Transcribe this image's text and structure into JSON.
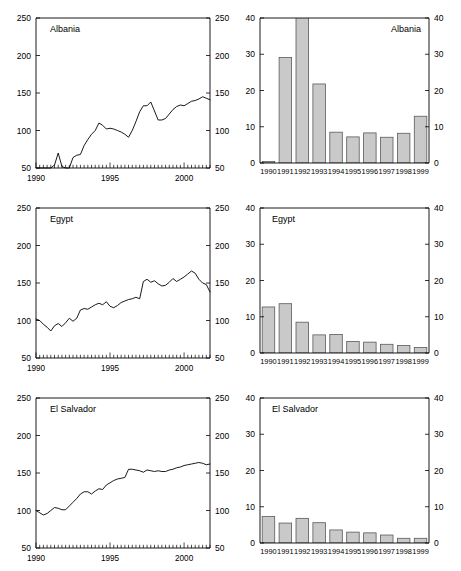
{
  "figure": {
    "layout": "3 rows x 2 columns",
    "rows": [
      "Albania",
      "Egypt",
      "El Salvador"
    ],
    "bar_fill_color": "#c9c9c9",
    "bar_stroke_color": "#5a5a5a",
    "line_color": "#000000",
    "background_color": "#ffffff"
  },
  "chart_data": [
    {
      "id": "albania-line",
      "type": "line",
      "title": "Albania",
      "title_position": "top-left",
      "xlabel": "",
      "ylabel": "",
      "xlim": [
        1990.0,
        2001.75
      ],
      "ylim": [
        50,
        250
      ],
      "yticks": [
        50,
        100,
        150,
        200,
        250
      ],
      "ytick_labels": [
        "50",
        "100",
        "150",
        "200",
        "250"
      ],
      "dual_y_axis": true,
      "xticks": [
        1990,
        1995,
        2000
      ],
      "xtick_labels": [
        "1990",
        "1995",
        "2000"
      ],
      "minor_xtick_interval": 0.25,
      "grid": false,
      "x": [
        1990.0,
        1990.25,
        1990.5,
        1990.75,
        1991.0,
        1991.25,
        1991.5,
        1991.75,
        1992.0,
        1992.25,
        1992.5,
        1992.75,
        1993.0,
        1993.25,
        1993.5,
        1993.75,
        1994.0,
        1994.25,
        1994.5,
        1994.75,
        1995.0,
        1995.25,
        1995.5,
        1995.75,
        1996.0,
        1996.25,
        1996.5,
        1996.75,
        1997.0,
        1997.25,
        1997.5,
        1997.75,
        1998.0,
        1998.25,
        1998.5,
        1998.75,
        1999.0,
        1999.25,
        1999.5,
        1999.75,
        2000.0,
        2000.25,
        2000.5,
        2000.75,
        2001.0,
        2001.25,
        2001.5,
        2001.75
      ],
      "y": [
        50,
        50,
        50,
        50,
        50,
        54,
        70,
        52,
        50,
        50,
        64,
        67,
        68,
        80,
        88,
        95,
        100,
        110,
        107,
        102,
        103,
        102,
        100,
        98,
        95,
        91,
        100,
        112,
        125,
        133,
        133,
        138,
        126,
        114,
        114,
        116,
        122,
        128,
        132,
        134,
        133,
        136,
        139,
        140,
        142,
        145,
        143,
        141
      ]
    },
    {
      "id": "albania-bar",
      "type": "bar",
      "title": "Albania",
      "title_position": "top-right",
      "xlabel": "",
      "ylabel": "",
      "ylim": [
        0,
        40
      ],
      "yticks": [
        0,
        10,
        20,
        30,
        40
      ],
      "ytick_labels": [
        "0",
        "10",
        "20",
        "30",
        "40"
      ],
      "dual_y_axis": true,
      "categories": [
        "1990",
        "1991",
        "1992",
        "1993",
        "1994",
        "1995",
        "1996",
        "1997",
        "1998",
        "1999"
      ],
      "values": [
        0.4,
        29.1,
        48.0,
        21.8,
        8.5,
        7.2,
        8.3,
        7.1,
        8.2,
        12.9
      ],
      "clipped_bars": [
        {
          "category": "1992",
          "note": "extends above axis maximum of 40"
        }
      ]
    },
    {
      "id": "egypt-line",
      "type": "line",
      "title": "Egypt",
      "title_position": "top-left",
      "xlabel": "",
      "ylabel": "",
      "xlim": [
        1990.0,
        2001.75
      ],
      "ylim": [
        50,
        250
      ],
      "yticks": [
        50,
        100,
        150,
        200,
        250
      ],
      "ytick_labels": [
        "50",
        "100",
        "150",
        "200",
        "250"
      ],
      "dual_y_axis": true,
      "xticks": [
        1990,
        1995,
        2000
      ],
      "xtick_labels": [
        "1990",
        "1995",
        "2000"
      ],
      "minor_xtick_interval": 0.25,
      "grid": false,
      "x": [
        1990.0,
        1990.25,
        1990.5,
        1990.75,
        1991.0,
        1991.25,
        1991.5,
        1991.75,
        1992.0,
        1992.25,
        1992.5,
        1992.75,
        1993.0,
        1993.25,
        1993.5,
        1993.75,
        1994.0,
        1994.25,
        1994.5,
        1994.75,
        1995.0,
        1995.25,
        1995.5,
        1995.75,
        1996.0,
        1996.25,
        1996.5,
        1996.75,
        1997.0,
        1997.25,
        1997.5,
        1997.75,
        1998.0,
        1998.25,
        1998.5,
        1998.75,
        1999.0,
        1999.25,
        1999.5,
        1999.75,
        2000.0,
        2000.25,
        2000.5,
        2000.75,
        2001.0,
        2001.25,
        2001.5,
        2001.75
      ],
      "y": [
        102,
        100,
        95,
        91,
        86,
        93,
        96,
        92,
        97,
        103,
        99,
        103,
        114,
        116,
        115,
        118,
        121,
        123,
        121,
        125,
        119,
        117,
        120,
        124,
        126,
        128,
        129,
        131,
        129,
        152,
        155,
        151,
        153,
        149,
        146,
        147,
        151,
        156,
        152,
        155,
        158,
        162,
        166,
        163,
        155,
        150,
        148,
        138
      ]
    },
    {
      "id": "egypt-bar",
      "type": "bar",
      "title": "Egypt",
      "title_position": "top-left",
      "xlabel": "",
      "ylabel": "",
      "ylim": [
        0,
        40
      ],
      "yticks": [
        0,
        10,
        20,
        30,
        40
      ],
      "ytick_labels": [
        "0",
        "10",
        "20",
        "30",
        "40"
      ],
      "dual_y_axis": true,
      "categories": [
        "1990",
        "1991",
        "1992",
        "1993",
        "1994",
        "1995",
        "1996",
        "1997",
        "1998",
        "1999"
      ],
      "values": [
        12.7,
        13.6,
        8.5,
        5.0,
        5.1,
        3.2,
        3.0,
        2.4,
        2.1,
        1.5
      ]
    },
    {
      "id": "el-salvador-line",
      "type": "line",
      "title": "El Salvador",
      "title_position": "top-left",
      "xlabel": "",
      "ylabel": "",
      "xlim": [
        1990.0,
        2001.75
      ],
      "ylim": [
        50,
        250
      ],
      "yticks": [
        50,
        100,
        150,
        200,
        250
      ],
      "ytick_labels": [
        "50",
        "100",
        "150",
        "200",
        "250"
      ],
      "dual_y_axis": true,
      "xticks": [
        1990,
        1995,
        2000
      ],
      "xtick_labels": [
        "1990",
        "1995",
        "2000"
      ],
      "minor_xtick_interval": 0.25,
      "grid": false,
      "x": [
        1990.0,
        1990.25,
        1990.5,
        1990.75,
        1991.0,
        1991.25,
        1991.5,
        1991.75,
        1992.0,
        1992.25,
        1992.5,
        1992.75,
        1993.0,
        1993.25,
        1993.5,
        1993.75,
        1994.0,
        1994.25,
        1994.5,
        1994.75,
        1995.0,
        1995.25,
        1995.5,
        1995.75,
        1996.0,
        1996.25,
        1996.5,
        1996.75,
        1997.0,
        1997.25,
        1997.5,
        1997.75,
        1998.0,
        1998.25,
        1998.5,
        1998.75,
        1999.0,
        1999.25,
        1999.5,
        1999.75,
        2000.0,
        2000.25,
        2000.5,
        2000.75,
        2001.0,
        2001.25,
        2001.5,
        2001.75
      ],
      "y": [
        100,
        97,
        94,
        96,
        100,
        104,
        103,
        101,
        101,
        106,
        111,
        116,
        122,
        125,
        125,
        122,
        126,
        129,
        128,
        134,
        137,
        140,
        142,
        143,
        144,
        155,
        155,
        154,
        153,
        151,
        154,
        153,
        152,
        153,
        152,
        152,
        154,
        155,
        157,
        158,
        160,
        161,
        162,
        163,
        164,
        163,
        161,
        162
      ]
    },
    {
      "id": "el-salvador-bar",
      "type": "bar",
      "title": "El Salvador",
      "title_position": "top-left",
      "xlabel": "",
      "ylabel": "",
      "ylim": [
        0,
        40
      ],
      "yticks": [
        0,
        10,
        20,
        30,
        40
      ],
      "ytick_labels": [
        "0",
        "10",
        "20",
        "30",
        "40"
      ],
      "dual_y_axis": true,
      "categories": [
        "1990",
        "1991",
        "1992",
        "1993",
        "1994",
        "1995",
        "1996",
        "1997",
        "1998",
        "1999"
      ],
      "values": [
        7.3,
        5.5,
        6.8,
        5.6,
        3.6,
        3.0,
        2.8,
        2.2,
        1.3,
        1.3
      ]
    }
  ]
}
